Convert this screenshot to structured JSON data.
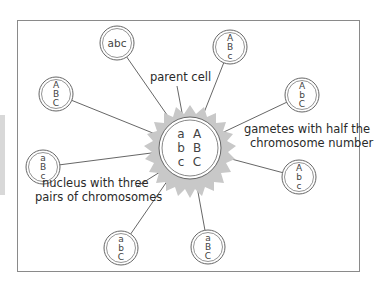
{
  "diagram": {
    "parent_cell": {
      "label": "parent cell",
      "chromosomes": [
        [
          "a",
          "A"
        ],
        [
          "b",
          "B"
        ],
        [
          "c",
          "C"
        ]
      ]
    },
    "nucleus_label_line1": "nucleus with three",
    "nucleus_label_line2": "pairs of chromosomes",
    "gametes_label_line1": "gametes with half the",
    "gametes_label_line2": "chromosome number",
    "gametes": [
      {
        "id": "g1",
        "letters": "abc",
        "layout": "horizontal"
      },
      {
        "id": "g2",
        "letters": [
          "A",
          "B",
          "c"
        ],
        "layout": "vertical"
      },
      {
        "id": "g3",
        "letters": [
          "A",
          "b",
          "C"
        ],
        "layout": "vertical"
      },
      {
        "id": "g4",
        "letters": [
          "A",
          "b",
          "c"
        ],
        "layout": "vertical"
      },
      {
        "id": "g5",
        "letters": [
          "a",
          "B",
          "C"
        ],
        "layout": "vertical"
      },
      {
        "id": "g6",
        "letters": [
          "a",
          "b",
          "C"
        ],
        "layout": "vertical"
      },
      {
        "id": "g7",
        "letters": [
          "a",
          "B",
          "c"
        ],
        "layout": "vertical"
      },
      {
        "id": "g8",
        "letters": [
          "A",
          "B",
          "C"
        ],
        "layout": "vertical"
      }
    ],
    "colors": {
      "line": "#555555",
      "starburst": "#c8c8c8",
      "frame": "#8a8a8a",
      "text": "#2a2a2a"
    }
  }
}
